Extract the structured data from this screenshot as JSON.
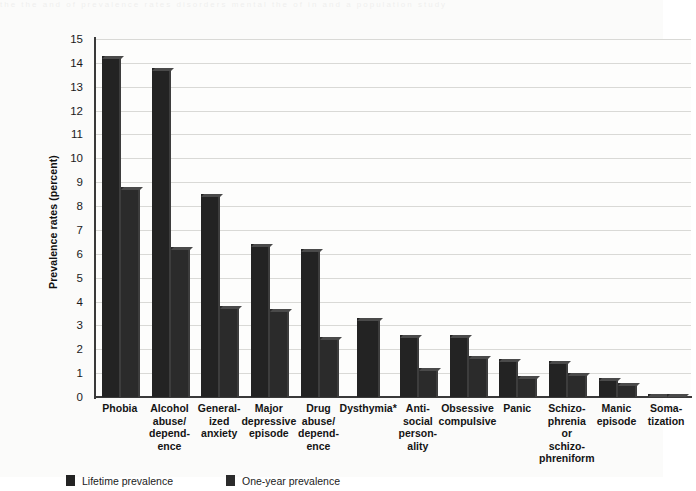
{
  "chart_data": {
    "type": "bar",
    "title": "",
    "xlabel": "",
    "ylabel": "Prevalence rates (percent)",
    "ylim": [
      0,
      15
    ],
    "ytick_labels": [
      "0",
      "1",
      "2",
      "3",
      "4",
      "5",
      "6",
      "7",
      "8",
      "9",
      "10",
      "11",
      "12",
      "13",
      "14",
      "15"
    ],
    "grid": true,
    "legend_position": "bottom-left",
    "categories": [
      "Phobia",
      "Alcohol abuse/ dependence",
      "Generalized anxiety",
      "Major depressive episode",
      "Drug abuse/ dependence",
      "Dysthymia*",
      "Antisocial personality",
      "Obsessive compulsive",
      "Panic",
      "Schizophrenia or schizophreniform",
      "Manic episode",
      "Somatization"
    ],
    "category_lines": [
      [
        "Phobia"
      ],
      [
        "Alcohol",
        "abuse/",
        "depend-",
        "ence"
      ],
      [
        "General-",
        "ized",
        "anxiety"
      ],
      [
        "Major",
        "depressive",
        "episode"
      ],
      [
        "Drug",
        "abuse/",
        "depend-",
        "ence"
      ],
      [
        "Dysthymia*"
      ],
      [
        "Anti-",
        "social",
        "person-",
        "ality"
      ],
      [
        "Obsessive",
        "compulsive"
      ],
      [
        "Panic"
      ],
      [
        "Schizo-",
        "phrenia",
        "or",
        "schizo-",
        "phreniform"
      ],
      [
        "Manic",
        "episode"
      ],
      [
        "Soma-",
        "tization"
      ]
    ],
    "series": [
      {
        "name": "Lifetime prevalence",
        "color": "#232323",
        "values": [
          14.3,
          13.8,
          8.5,
          6.4,
          6.2,
          3.3,
          2.6,
          2.6,
          1.6,
          1.5,
          0.8,
          0.14
        ]
      },
      {
        "name": "One-year prevalence",
        "color": "#2b2b2b",
        "values": [
          8.8,
          6.3,
          3.8,
          3.7,
          2.5,
          null,
          1.2,
          1.7,
          0.9,
          1.0,
          0.6,
          0.13
        ]
      }
    ],
    "footnote_marker": "*"
  },
  "legend": {
    "items": [
      {
        "label": "Lifetime prevalence",
        "color": "#232323"
      },
      {
        "label": "One-year prevalence",
        "color": "#2b2b2b"
      }
    ]
  },
  "bleed_text": "the the and of prevalence rates disorders mental the of in and a population study"
}
